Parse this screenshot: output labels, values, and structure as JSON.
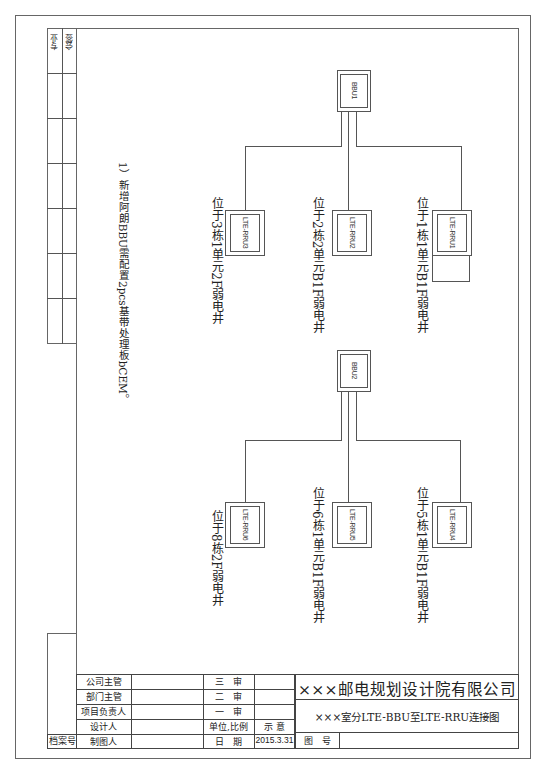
{
  "side_column": {
    "headers": [
      "专业",
      "会签"
    ]
  },
  "note": {
    "text": "1）新增阿朗BBU需配置2pcs基带处理板bCEM。"
  },
  "diagram": {
    "groups": [
      {
        "bbu": {
          "label": "BBU1"
        },
        "rrus": [
          {
            "label": "LTE-RRU3",
            "location": "位于3栋1单元2F弱电井"
          },
          {
            "label": "LTE-RRU2",
            "location": "位于2栋2单元B1F弱电井"
          },
          {
            "label": "LTE-RRU1",
            "location": "位于1栋1单元B1F弱电井"
          }
        ]
      },
      {
        "bbu": {
          "label": "BBU2"
        },
        "rrus": [
          {
            "label": "LTE-RRU6",
            "location": "位于8栋2F弱电井"
          },
          {
            "label": "LTE-RRU5",
            "location": "位于6栋1单元B1F弱电井"
          },
          {
            "label": "LTE-RRU4",
            "location": "位于5栋1单元B1F弱电井"
          }
        ]
      }
    ]
  },
  "title_block": {
    "archive_label": "档案号",
    "roles": [
      "公司主管",
      "部门主管",
      "项目负责人",
      "设计人",
      "制图人"
    ],
    "reviews": [
      "三　审",
      "二　审",
      "一　审",
      "单位,比例",
      "日　期"
    ],
    "review_values": [
      "",
      "",
      "",
      "示 意",
      "2015.3.31"
    ],
    "company": "×××邮电规划设计院有限公司",
    "drawing_title": "×××室分LTE-BBU至LTE-RRU连接图",
    "drawing_no_label": "图　号",
    "drawing_no_value": ""
  }
}
